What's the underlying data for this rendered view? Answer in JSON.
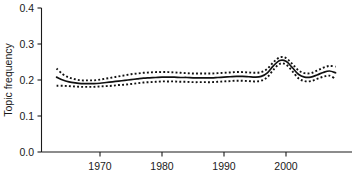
{
  "chart_data": {
    "type": "line",
    "title": "",
    "xlabel": "",
    "ylabel": "Topic frequency",
    "xlim": [
      1963,
      2008.5
    ],
    "ylim": [
      0.0,
      0.4
    ],
    "grid": false,
    "legend": "none",
    "x_ticks": [
      1970,
      1980,
      1990,
      2000
    ],
    "x_tick_labels": [
      "1970",
      "1980",
      "1990",
      "2000"
    ],
    "y_ticks": [
      0.0,
      0.1,
      0.2,
      0.3,
      0.4
    ],
    "y_tick_labels": [
      "0.0",
      "0.1",
      "0.2",
      "0.3",
      "0.4"
    ],
    "x": [
      1963,
      1964,
      1965,
      1966,
      1967,
      1968,
      1969,
      1970,
      1971,
      1972,
      1973,
      1974,
      1975,
      1976,
      1977,
      1978,
      1979,
      1980,
      1981,
      1982,
      1983,
      1984,
      1985,
      1986,
      1987,
      1988,
      1989,
      1990,
      1991,
      1992,
      1993,
      1994,
      1995,
      1996,
      1997,
      1998,
      1999,
      2000,
      2001,
      2002,
      2003,
      2004,
      2005,
      2006,
      2007,
      2008
    ],
    "series": [
      {
        "name": "Estimate",
        "style": "solid",
        "color": "#111111",
        "values": [
          0.208,
          0.2,
          0.195,
          0.192,
          0.19,
          0.19,
          0.19,
          0.191,
          0.193,
          0.195,
          0.197,
          0.199,
          0.201,
          0.203,
          0.205,
          0.206,
          0.207,
          0.208,
          0.208,
          0.208,
          0.207,
          0.207,
          0.206,
          0.206,
          0.206,
          0.206,
          0.207,
          0.208,
          0.209,
          0.21,
          0.21,
          0.209,
          0.208,
          0.21,
          0.22,
          0.24,
          0.254,
          0.252,
          0.235,
          0.216,
          0.208,
          0.208,
          0.214,
          0.221,
          0.225,
          0.22
        ]
      },
      {
        "name": "Upper confidence band",
        "style": "dotted",
        "color": "#111111",
        "values": [
          0.232,
          0.216,
          0.207,
          0.202,
          0.199,
          0.199,
          0.199,
          0.201,
          0.204,
          0.207,
          0.21,
          0.213,
          0.216,
          0.218,
          0.22,
          0.221,
          0.222,
          0.222,
          0.222,
          0.221,
          0.22,
          0.219,
          0.218,
          0.218,
          0.218,
          0.218,
          0.219,
          0.22,
          0.221,
          0.222,
          0.222,
          0.221,
          0.22,
          0.222,
          0.231,
          0.25,
          0.263,
          0.261,
          0.245,
          0.227,
          0.219,
          0.219,
          0.226,
          0.234,
          0.239,
          0.237
        ]
      },
      {
        "name": "Lower confidence band",
        "style": "dotted",
        "color": "#111111",
        "values": [
          0.184,
          0.184,
          0.183,
          0.182,
          0.181,
          0.181,
          0.181,
          0.182,
          0.183,
          0.184,
          0.186,
          0.187,
          0.189,
          0.191,
          0.193,
          0.194,
          0.195,
          0.196,
          0.196,
          0.196,
          0.195,
          0.195,
          0.194,
          0.194,
          0.194,
          0.194,
          0.195,
          0.196,
          0.197,
          0.198,
          0.198,
          0.197,
          0.196,
          0.198,
          0.208,
          0.229,
          0.245,
          0.243,
          0.225,
          0.205,
          0.197,
          0.197,
          0.203,
          0.209,
          0.212,
          0.203
        ]
      }
    ]
  },
  "axes": {
    "y_axis_name": "Topic frequency",
    "x_axis_name": ""
  }
}
